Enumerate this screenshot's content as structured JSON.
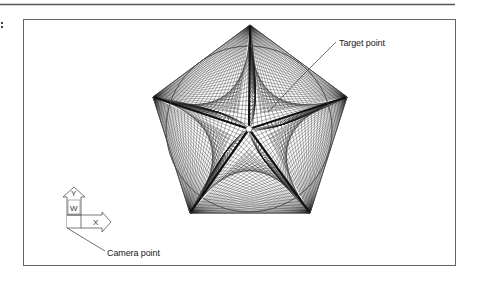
{
  "figure": {
    "top_rule_color": "#555555",
    "frame_color": "#666666",
    "line_color": "#333333",
    "mesh_color": "#1a1a1a"
  },
  "annotations": {
    "target_label": "Target point",
    "camera_label": "Camera point"
  },
  "ucs_icon": {
    "y_axis_label": "Y",
    "x_axis_label": "X",
    "world_marker": "W"
  },
  "geometry": {
    "center": [
      249,
      129
    ],
    "pentagon_vertices": [
      [
        250,
        25
      ],
      [
        347,
        97
      ],
      [
        310,
        213
      ],
      [
        190,
        213
      ],
      [
        153,
        97
      ]
    ],
    "circle_radius": 83,
    "mesh_divisions": 22
  }
}
